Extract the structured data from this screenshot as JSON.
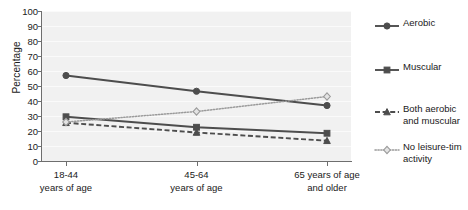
{
  "chart_data": {
    "type": "line",
    "title": "",
    "xlabel": "",
    "ylabel": "Percentage",
    "ylim": [
      0,
      100
    ],
    "yticks": [
      0,
      10,
      20,
      30,
      40,
      50,
      60,
      70,
      80,
      90,
      100
    ],
    "grid": true,
    "legend_position": "right",
    "categories": [
      "18-44 years of age",
      "45-64 years of age",
      "65 years of age and older"
    ],
    "category_lines": [
      [
        "18-44",
        "years of age"
      ],
      [
        "45-64",
        "years of age"
      ],
      [
        "65 years of age",
        "and older"
      ]
    ],
    "series": [
      {
        "name": "Aerobic",
        "values": [
          57.0,
          46.5,
          37.0
        ],
        "marker": "circle",
        "linestyle": "solid",
        "color": "#4d4d4d"
      },
      {
        "name": "Muscular",
        "values": [
          29.5,
          22.5,
          18.5
        ],
        "marker": "square",
        "linestyle": "solid",
        "color": "#4d4d4d"
      },
      {
        "name": "Both aerobic and muscular",
        "values": [
          25.5,
          19.0,
          13.5
        ],
        "marker": "triangle",
        "linestyle": "dashed",
        "color": "#4d4d4d"
      },
      {
        "name": "No leisure-tim activity",
        "values": [
          26.0,
          33.0,
          43.0
        ],
        "marker": "diamond",
        "linestyle": "dotted",
        "color": "#9a9a9a"
      }
    ]
  },
  "legend": {
    "entries": [
      {
        "label_lines": [
          "Aerobic"
        ],
        "marker": "circle-icon",
        "linestyle": "solid"
      },
      {
        "label_lines": [
          "Muscular"
        ],
        "marker": "square-icon",
        "linestyle": "solid"
      },
      {
        "label_lines": [
          "Both aerobic",
          "and muscular"
        ],
        "marker": "triangle-icon",
        "linestyle": "dashed"
      },
      {
        "label_lines": [
          "No leisure-tim",
          "activity"
        ],
        "marker": "diamond-icon",
        "linestyle": "dotted"
      }
    ]
  },
  "colors": {
    "plot_background": "#f1f1f1",
    "gridline": "#fafafa",
    "axis": "#6e6e6e",
    "series_dark": "#4d4d4d",
    "series_light": "#9a9a9a",
    "text": "#1a1a1a"
  }
}
